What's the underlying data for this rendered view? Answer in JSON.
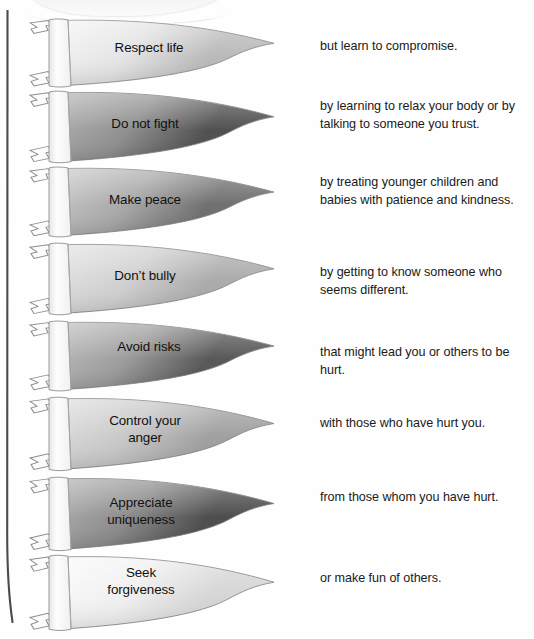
{
  "page": {
    "background_color": "#ffffff",
    "text_color": "#1a1a1a",
    "spine_color": "#4a4a50"
  },
  "flags": [
    {
      "label": "Respect life",
      "note": "but learn to compromise.",
      "shade_light": "#f4f4f4",
      "shade_mid": "#e3e3e3",
      "shade_dark": "#b9b9b9",
      "tone": "very-light"
    },
    {
      "label": "Do not fight",
      "note": "by learning to relax your body or\nby talking to someone you trust.",
      "shade_light": "#b2b2b2",
      "shade_mid": "#8e8e8e",
      "shade_dark": "#4d4d4d",
      "tone": "dark"
    },
    {
      "label": "Make peace",
      "note": "by treating younger children\nand babies with patience and\nkindness.",
      "shade_light": "#c9c9c9",
      "shade_mid": "#a6a6a6",
      "shade_dark": "#6d6d6d",
      "tone": "medium-dark"
    },
    {
      "label": "Don’t bully",
      "note": "by getting to know someone\nwho seems different.",
      "shade_light": "#e2e2e2",
      "shade_mid": "#cfcfcf",
      "shade_dark": "#a9a9a9",
      "tone": "light"
    },
    {
      "label": "Avoid risks",
      "note": "that might lead you or others to\nbe hurt.",
      "shade_light": "#bdbdbd",
      "shade_mid": "#9a9a9a",
      "shade_dark": "#555555",
      "tone": "dark"
    },
    {
      "label": "Control your\nanger",
      "note": "with those who have hurt you.",
      "shade_light": "#dedede",
      "shade_mid": "#c6c6c6",
      "shade_dark": "#9e9e9e",
      "tone": "light"
    },
    {
      "label": "Appreciate\nuniqueness",
      "note": "from those whom you have hurt.",
      "shade_light": "#b0b0b0",
      "shade_mid": "#8a8a8a",
      "shade_dark": "#4a4a4a",
      "tone": "darkest"
    },
    {
      "label": "Seek\nforgiveness",
      "note": "or make fun of others.",
      "shade_light": "#fafafa",
      "shade_mid": "#efefef",
      "shade_dark": "#d5d5d5",
      "tone": "lightest"
    }
  ]
}
